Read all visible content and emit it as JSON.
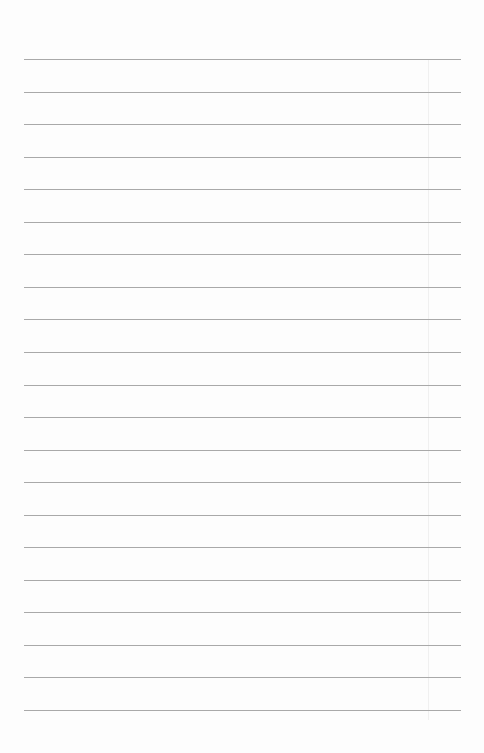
{
  "document": {
    "type": "lined-paper",
    "text_content": "",
    "line_count": 21,
    "first_line_y": 59,
    "line_spacing": 32.55,
    "line_left": 24,
    "line_right": 461,
    "line_color": "#a9a9a9",
    "background_color": "#fdfdfd"
  }
}
